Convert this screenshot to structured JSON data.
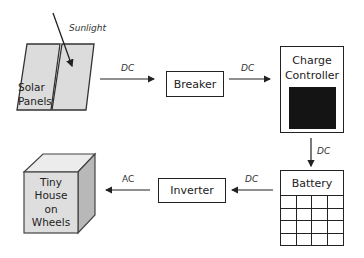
{
  "diagram": {
    "components": {
      "solar_panels": "Solar Panels",
      "solar_line1": "Solar",
      "solar_line2": "Panels",
      "sunlight": "Sunlight",
      "breaker": "Breaker",
      "charge_controller_line1": "Charge",
      "charge_controller_line2": "Controller",
      "battery": "Battery",
      "inverter": "Inverter",
      "house_line1": "Tiny",
      "house_line2": "House",
      "house_line3": "on",
      "house_line4": "Wheels"
    },
    "connections": [
      {
        "from": "Solar Panels",
        "to": "Breaker",
        "label": "DC"
      },
      {
        "from": "Breaker",
        "to": "Charge Controller",
        "label": "DC"
      },
      {
        "from": "Charge Controller",
        "to": "Battery",
        "label": "DC"
      },
      {
        "from": "Battery",
        "to": "Inverter",
        "label": "DC"
      },
      {
        "from": "Inverter",
        "to": "Tiny House on Wheels",
        "label": "AC"
      }
    ],
    "colors": {
      "panel_fill": "#dcdcdc",
      "cube_front": "#dedede",
      "cube_top": "#ececec",
      "cube_side": "#b8b8b8",
      "screen": "#141414",
      "stroke": "#222222"
    }
  }
}
